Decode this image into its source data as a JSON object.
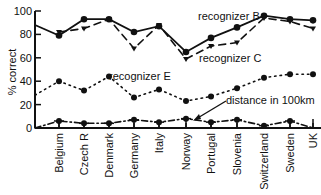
{
  "chart_data": {
    "type": "line",
    "title": "",
    "xlabel": "",
    "ylabel": "% correct",
    "ylim": [
      0,
      100
    ],
    "yticks": [
      0,
      20,
      40,
      60,
      80,
      100
    ],
    "grid": false,
    "legend": "inline annotations",
    "categories": [
      "Belgium",
      "Czech R",
      "Denmark",
      "Germany",
      "Italy",
      "Norway",
      "Portugal",
      "Slovenia",
      "Switzerland",
      "Sweden",
      "UK"
    ],
    "series": [
      {
        "name": "recognizer B",
        "style": "solid",
        "values": [
          79,
          93,
          93,
          82,
          87,
          65,
          77,
          86,
          96,
          93,
          92
        ]
      },
      {
        "name": "recognizer C",
        "style": "dashed",
        "values": [
          82,
          85,
          93,
          68,
          88,
          59,
          70,
          73,
          94,
          91,
          85
        ]
      },
      {
        "name": "recognizer E",
        "style": "dotted",
        "values": [
          40,
          32,
          44,
          26,
          33,
          23,
          27,
          34,
          43,
          46,
          46
        ]
      },
      {
        "name": "distance in 100km",
        "style": "dash-dot",
        "values": [
          6,
          4,
          4,
          7,
          5,
          8,
          5,
          7,
          2,
          6,
          0
        ]
      }
    ],
    "annotations": [
      {
        "text": "recognizer B",
        "series": "recognizer B"
      },
      {
        "text": "recognizer C",
        "series": "recognizer C"
      },
      {
        "text": "recognizer E",
        "series": "recognizer E"
      },
      {
        "text": "distance in 100km",
        "series": "distance in 100km",
        "arrow": true
      }
    ]
  }
}
